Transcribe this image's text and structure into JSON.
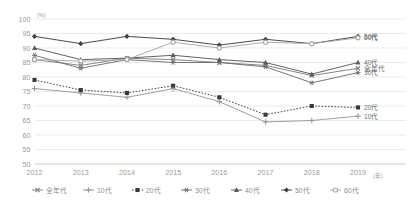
{
  "chart_data": {
    "type": "line",
    "title": "",
    "subtitle": "",
    "xlabel": "年",
    "ylabel": "%",
    "y_unit_label": "(%)",
    "x_unit_label": "(年)",
    "grid": true,
    "legend_position": "bottom",
    "xlim": [
      2012,
      2019
    ],
    "ylim": [
      50,
      100
    ],
    "y_ticks": [
      50,
      55,
      60,
      65,
      70,
      75,
      80,
      85,
      90,
      95,
      100
    ],
    "categories": [
      "2012",
      "2013",
      "2014",
      "2015",
      "2016",
      "2017",
      "2018",
      "2019"
    ],
    "x": [
      2012,
      2013,
      2014,
      2015,
      2016,
      2017,
      2018,
      2019
    ],
    "series": [
      {
        "name": "全年代",
        "marker": "cross-x",
        "color": "#808080",
        "dash": "solid",
        "end_label": "全年代",
        "values": [
          86,
          84,
          86.5,
          86,
          85,
          84,
          80.5,
          83
        ]
      },
      {
        "name": "10代",
        "marker": "plus",
        "color": "#9a9a9a",
        "dash": "solid",
        "end_label": "10代",
        "values": [
          76,
          74.5,
          73,
          76,
          71.5,
          64.5,
          65,
          66.5
        ]
      },
      {
        "name": "20代",
        "marker": "square",
        "color": "#3a3a3a",
        "dash": "dotted",
        "end_label": "20代",
        "values": [
          79,
          75.5,
          74.5,
          77,
          73,
          67,
          70,
          69.5
        ]
      },
      {
        "name": "30代",
        "marker": "asterisk",
        "color": "#707070",
        "dash": "solid",
        "end_label": "30代",
        "values": [
          87.5,
          83,
          86,
          85,
          85,
          83.5,
          78,
          81.5
        ]
      },
      {
        "name": "40代",
        "marker": "triangle",
        "color": "#5a5a5a",
        "dash": "solid",
        "end_label": "40代",
        "values": [
          90,
          86,
          86.5,
          87.5,
          86,
          85,
          81,
          85
        ]
      },
      {
        "name": "50代",
        "marker": "diamond",
        "color": "#404040",
        "dash": "solid",
        "end_label": "50代",
        "values": [
          94,
          91.5,
          94,
          93,
          91,
          93,
          91.5,
          94
        ]
      },
      {
        "name": "60代",
        "marker": "circle-open",
        "color": "#a8a8a8",
        "dash": "solid",
        "end_label": "60代",
        "values": [
          86,
          85.5,
          86,
          92,
          90,
          92,
          91.5,
          93.5
        ]
      }
    ],
    "legend": [
      "全年代",
      "10代",
      "20代",
      "30代",
      "40代",
      "50代",
      "60代"
    ],
    "right_edge_labels": [
      "60代",
      "50代",
      "40代",
      "全年代",
      "30代",
      "20代",
      "10代"
    ],
    "colors": {
      "grid": "#e2e2e2",
      "axis": "#d0d0d0",
      "tick_text": "#9a9a9a",
      "legend_text": "#8d8d8d",
      "end_label_text": "#6e6e6e"
    }
  }
}
